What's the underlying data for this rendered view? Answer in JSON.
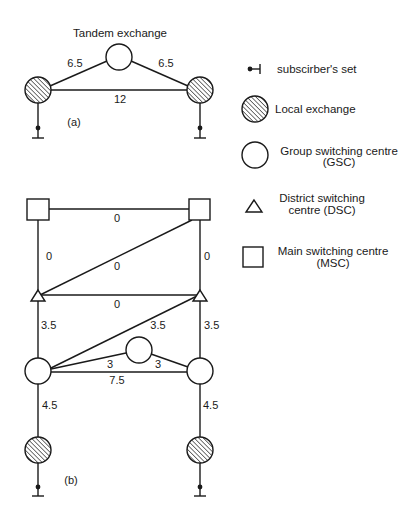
{
  "diagram_a": {
    "title": "Tandem exchange",
    "caption": "(a)",
    "links": {
      "left_to_tandem": "6.5",
      "tandem_to_right": "6.5",
      "left_to_right": "12"
    }
  },
  "diagram_b": {
    "caption": "(b)",
    "links": {
      "msc_top": "0",
      "msc_left_to_dsc_left": "0",
      "msc_right_to_dsc_right": "0",
      "msc_right_to_dsc_left_diag": "0",
      "dsc_horizontal": "0",
      "dsc_left_to_gsc_left": "3.5",
      "gsc_left_to_dsc_right_diag": "3.5",
      "dsc_right_to_gsc_right": "3.5",
      "gsc_left_to_gsc_mid": "3",
      "gsc_mid_to_gsc_right": "3",
      "gsc_horizontal": "7.5",
      "gsc_left_to_le_left": "4.5",
      "gsc_right_to_le_right": "4.5"
    }
  },
  "legend": {
    "items": [
      {
        "icon": "subscriber-set-icon",
        "label_line1": "subscirber's set",
        "label_line2": ""
      },
      {
        "icon": "local-exchange-icon",
        "label_line1": "Local exchange",
        "label_line2": ""
      },
      {
        "icon": "group-switching-centre-icon",
        "label_line1": "Group switching centre",
        "label_line2": "(GSC)"
      },
      {
        "icon": "district-switching-centre-icon",
        "label_line1": "District switching",
        "label_line2": "centre (DSC)"
      },
      {
        "icon": "main-switching-centre-icon",
        "label_line1": "Main switching centre",
        "label_line2": "(MSC)"
      }
    ]
  }
}
